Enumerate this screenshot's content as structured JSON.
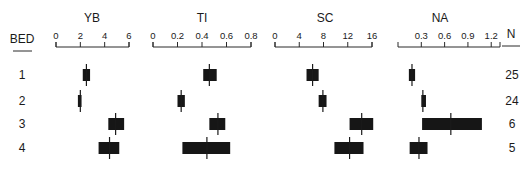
{
  "chart_data": {
    "type": "box",
    "row_header": "BED",
    "n_header": "N",
    "rows": [
      {
        "bed": "1",
        "n": "25"
      },
      {
        "bed": "2",
        "n": "24"
      },
      {
        "bed": "3",
        "n": "6"
      },
      {
        "bed": "4",
        "n": "5"
      }
    ],
    "panels": [
      {
        "title": "YB",
        "xlim": [
          0,
          6
        ],
        "ticks": [
          "0",
          "2",
          "4",
          "6"
        ],
        "tick_values": [
          0,
          2,
          4,
          6
        ],
        "series": [
          {
            "bed": "1",
            "low": 2.2,
            "median": 2.5,
            "high": 2.8
          },
          {
            "bed": "2",
            "low": 1.8,
            "median": 2.0,
            "high": 2.1
          },
          {
            "bed": "3",
            "low": 4.3,
            "median": 4.9,
            "high": 5.6
          },
          {
            "bed": "4",
            "low": 3.5,
            "median": 4.4,
            "high": 5.2
          }
        ]
      },
      {
        "title": "TI",
        "xlim": [
          0,
          0.8
        ],
        "ticks": [
          "0",
          "0.2",
          "0.4",
          "0.6",
          "0.8"
        ],
        "tick_values": [
          0,
          0.2,
          0.4,
          0.6,
          0.8
        ],
        "series": [
          {
            "bed": "1",
            "low": 0.41,
            "median": 0.46,
            "high": 0.52
          },
          {
            "bed": "2",
            "low": 0.2,
            "median": 0.23,
            "high": 0.26
          },
          {
            "bed": "3",
            "low": 0.46,
            "median": 0.53,
            "high": 0.59
          },
          {
            "bed": "4",
            "low": 0.24,
            "median": 0.44,
            "high": 0.63
          }
        ]
      },
      {
        "title": "SC",
        "xlim": [
          0,
          16
        ],
        "ticks": [
          "0",
          "4",
          "8",
          "12",
          "16"
        ],
        "tick_values": [
          0,
          4,
          8,
          12,
          16
        ],
        "series": [
          {
            "bed": "1",
            "low": 5.2,
            "median": 6.2,
            "high": 7.2
          },
          {
            "bed": "2",
            "low": 7.2,
            "median": 7.9,
            "high": 8.5
          },
          {
            "bed": "3",
            "low": 12.3,
            "median": 14.3,
            "high": 16.2
          },
          {
            "bed": "4",
            "low": 9.8,
            "median": 12.3,
            "high": 14.6
          }
        ]
      },
      {
        "title": "NA",
        "xlim": [
          0,
          1.3
        ],
        "ticks": [
          "0.3",
          "0.6",
          "0.9",
          "1.2"
        ],
        "tick_values": [
          0.3,
          0.6,
          0.9,
          1.2
        ],
        "series": [
          {
            "bed": "1",
            "low": 0.14,
            "median": 0.18,
            "high": 0.22
          },
          {
            "bed": "2",
            "low": 0.3,
            "median": 0.32,
            "high": 0.36
          },
          {
            "bed": "3",
            "low": 0.31,
            "median": 0.68,
            "high": 1.08
          },
          {
            "bed": "4",
            "low": 0.15,
            "median": 0.27,
            "high": 0.38
          }
        ]
      }
    ],
    "grid": false,
    "legend": null
  },
  "layout": {
    "panels_px": [
      {
        "x0": 56,
        "x1": 129,
        "axis_min_px": 56,
        "axis_max_px": 129
      },
      {
        "x0": 153,
        "x1": 251,
        "axis_min_px": 153,
        "axis_max_px": 251
      },
      {
        "x0": 275,
        "x1": 372,
        "axis_min_px": 275,
        "axis_max_px": 372
      },
      {
        "x0": 398,
        "x1": 500,
        "axis_min_px": 398,
        "axis_max_px": 499
      }
    ],
    "row_y": [
      75,
      101,
      124,
      148
    ],
    "colors": {
      "ink": "#161616",
      "background": "#ffffff"
    }
  }
}
